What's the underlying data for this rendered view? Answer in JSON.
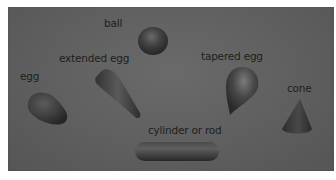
{
  "figure": {
    "background_color": "#616161",
    "shape_color": "#3e3e3e",
    "labels": [
      {
        "id": "ball",
        "text": "ball"
      },
      {
        "id": "extended-egg",
        "text": "extended egg"
      },
      {
        "id": "egg",
        "text": "egg"
      },
      {
        "id": "tapered-egg",
        "text": "tapered egg"
      },
      {
        "id": "cone",
        "text": "cone"
      },
      {
        "id": "cylinder",
        "text": "cylinder or rod"
      }
    ]
  }
}
